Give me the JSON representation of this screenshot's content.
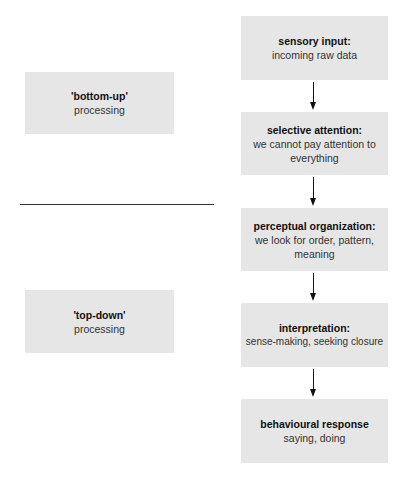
{
  "diagram": {
    "left_labels": [
      {
        "title": "'bottom-up'",
        "subtitle": "processing"
      },
      {
        "title": "'top-down'",
        "subtitle": "processing"
      }
    ],
    "flow_steps": [
      {
        "title": "sensory input:",
        "subtitle": "incoming raw data"
      },
      {
        "title": "selective attention:",
        "subtitle": "we cannot pay attention to everything"
      },
      {
        "title": "perceptual organization:",
        "subtitle": "we look for order, pattern, meaning"
      },
      {
        "title": "interpretation:",
        "subtitle": "sense-making, seeking closure"
      },
      {
        "title": "behavioural response",
        "subtitle": "saying, doing"
      }
    ],
    "colors": {
      "box_fill": "#e6e6e6",
      "arrow": "#111111",
      "divider": "#333333"
    }
  }
}
